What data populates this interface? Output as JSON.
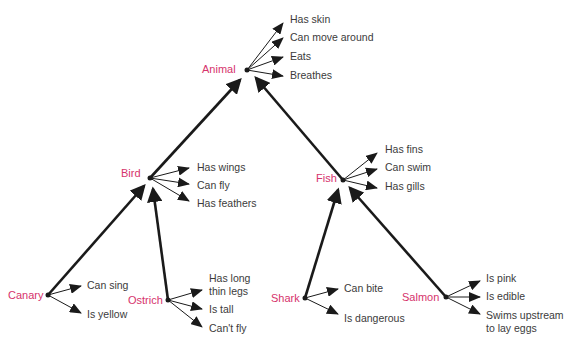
{
  "diagram": {
    "type": "semantic-network-hierarchy",
    "colors": {
      "concept_label": "#d6336c",
      "property_label": "#3b3b3b",
      "lines": "#1a1a1a",
      "background": "#ffffff"
    },
    "nodes": {
      "animal": {
        "label": "Animal",
        "properties": [
          "Has skin",
          "Can move around",
          "Eats",
          "Breathes"
        ]
      },
      "bird": {
        "label": "Bird",
        "properties": [
          "Has wings",
          "Can fly",
          "Has feathers"
        ]
      },
      "fish": {
        "label": "Fish",
        "properties": [
          "Has fins",
          "Can swim",
          "Has gills"
        ]
      },
      "canary": {
        "label": "Canary",
        "properties": [
          "Can sing",
          "Is yellow"
        ]
      },
      "ostrich": {
        "label": "Ostrich",
        "properties": [
          "Has long",
          "thin legs",
          "Is tall",
          "Can't fly"
        ]
      },
      "shark": {
        "label": "Shark",
        "properties": [
          "Can bite",
          "Is dangerous"
        ]
      },
      "salmon": {
        "label": "Salmon",
        "properties": [
          "Is pink",
          "Is edible",
          "Swims upstream",
          "to lay eggs"
        ]
      }
    },
    "edges": [
      {
        "from": "Bird",
        "to": "Animal"
      },
      {
        "from": "Fish",
        "to": "Animal"
      },
      {
        "from": "Canary",
        "to": "Bird"
      },
      {
        "from": "Ostrich",
        "to": "Bird"
      },
      {
        "from": "Shark",
        "to": "Fish"
      },
      {
        "from": "Salmon",
        "to": "Fish"
      }
    ]
  }
}
